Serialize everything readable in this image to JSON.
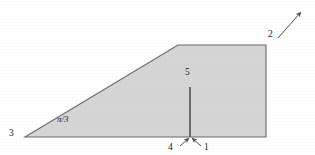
{
  "figure": {
    "type": "geometry-diagram",
    "background_color": "#ffffff",
    "fill_color": "#d6d6d6",
    "stroke_color": "#555555",
    "label_color": "#1b1b1b",
    "polygon": {
      "name": "shaded-trapezoid",
      "vertices": [
        {
          "name": "bottom-left-apex",
          "x": 25,
          "y": 137
        },
        {
          "name": "top-left-bend",
          "x": 178,
          "y": 45
        },
        {
          "name": "top-right-corner",
          "x": 266,
          "y": 45
        },
        {
          "name": "bottom-right-corner",
          "x": 266,
          "y": 137
        }
      ]
    },
    "segments": [
      {
        "name": "interior-vertical-segment",
        "x1": 190,
        "y1": 87,
        "x2": 190,
        "y2": 137
      }
    ],
    "arrows": [
      {
        "name": "arrow-label-2",
        "x1": 278,
        "y1": 38,
        "x2": 301,
        "y2": 12,
        "head_at": "end"
      },
      {
        "name": "arrow-label-4",
        "x1": 180,
        "y1": 146,
        "x2": 189,
        "y2": 138,
        "head_at": "end"
      },
      {
        "name": "arrow-label-1",
        "x1": 201,
        "y1": 146,
        "x2": 192,
        "y2": 138,
        "head_at": "end"
      }
    ],
    "labels": [
      {
        "name": "label-vertex-3",
        "text": "3",
        "x": 9,
        "y": 129,
        "italic": false
      },
      {
        "name": "label-angle-pi-over-3",
        "text": "π/3",
        "x": 57,
        "y": 115,
        "italic": true
      },
      {
        "name": "label-edge-5",
        "text": "5",
        "x": 185,
        "y": 68,
        "italic": false
      },
      {
        "name": "label-arrow-4",
        "text": "4",
        "x": 168,
        "y": 143,
        "italic": false
      },
      {
        "name": "label-arrow-1",
        "text": "1",
        "x": 204,
        "y": 143,
        "italic": false
      },
      {
        "name": "label-arrow-2",
        "text": "2",
        "x": 268,
        "y": 30,
        "italic": false
      }
    ]
  }
}
